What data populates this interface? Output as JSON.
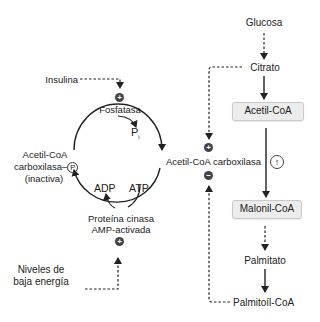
{
  "diagram": {
    "title": "",
    "left_cycle": {
      "insulina": "Insulina",
      "fosfatasa": "Fosfatasa",
      "pi": "P",
      "pi_sub": "i",
      "inactive_line1": "Acetil-CoA",
      "inactive_line2": "carboxilasa–",
      "inactive_p": "P",
      "inactive_line3": "(inactiva)",
      "adp": "ADP",
      "atp": "ATP",
      "kinase_line1": "Proteína cinasa",
      "kinase_line2": "AMP-activada",
      "energy_line1": "Niveles de",
      "energy_line2": "baja energía"
    },
    "center": {
      "enzyme": "Acetil-CoA carboxilasa",
      "activator_symbol": "+",
      "inhibitor_symbol": "−"
    },
    "pathway": {
      "glucosa": "Glucosa",
      "citrato": "Citrato",
      "acetil_coa": "Acetil-CoA",
      "up_symbol": "↑",
      "malonil_coa": "Malonil-CoA",
      "palmitato": "Palmitato",
      "palmitoil_coa": "Palmitoíl-CoA"
    },
    "badges": {
      "plus": "+",
      "minus": "−"
    },
    "colors": {
      "line": "#222222",
      "badge": "#444444",
      "box_fill": "#ececec",
      "box_border": "#c9c9c9"
    }
  }
}
